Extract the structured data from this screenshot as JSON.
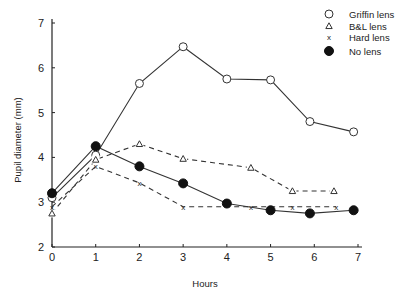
{
  "chart_data": {
    "type": "line",
    "title": "",
    "xlabel": "Hours",
    "ylabel": "Pupil diameter (mm)",
    "xlim": [
      0,
      7
    ],
    "ylim": [
      2,
      7
    ],
    "xticks": [
      0,
      1,
      2,
      3,
      4,
      5,
      6,
      7
    ],
    "yticks": [
      2,
      3,
      4,
      5,
      6,
      7
    ],
    "grid": false,
    "legend_position": "top-right",
    "series": [
      {
        "name": "Griffin lens",
        "marker": "open-circle",
        "line": "solid",
        "points": [
          [
            0,
            3.1
          ],
          [
            1,
            4.05
          ],
          [
            2,
            5.65
          ],
          [
            3,
            6.47
          ],
          [
            4,
            5.75
          ],
          [
            5,
            5.73
          ],
          [
            5.9,
            4.8
          ],
          [
            6.9,
            4.57
          ]
        ]
      },
      {
        "name": "B&L lens",
        "marker": "triangle",
        "line": "dashed",
        "points": [
          [
            0,
            2.75
          ],
          [
            1,
            3.95
          ],
          [
            2,
            4.3
          ],
          [
            3,
            3.97
          ],
          [
            4.55,
            3.77
          ],
          [
            5.5,
            3.25
          ],
          [
            6.45,
            3.25
          ]
        ]
      },
      {
        "name": "Hard lens",
        "marker": "x",
        "line": "dashed",
        "points": [
          [
            0,
            2.9
          ],
          [
            1,
            3.8
          ],
          [
            2,
            3.43
          ],
          [
            3,
            2.9
          ],
          [
            4.55,
            2.9
          ],
          [
            5.5,
            2.9
          ],
          [
            6.5,
            2.9
          ]
        ]
      },
      {
        "name": "No lens",
        "marker": "filled-circle",
        "line": "solid",
        "points": [
          [
            0,
            3.2
          ],
          [
            1,
            4.25
          ],
          [
            2,
            3.8
          ],
          [
            3,
            3.42
          ],
          [
            4,
            2.97
          ],
          [
            5,
            2.82
          ],
          [
            5.9,
            2.75
          ],
          [
            6.9,
            2.82
          ]
        ]
      }
    ]
  }
}
